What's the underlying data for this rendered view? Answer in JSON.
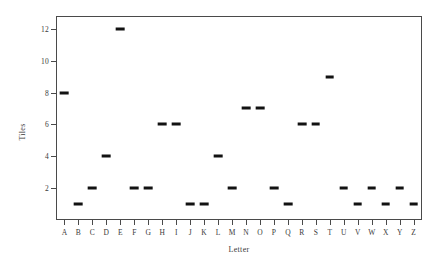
{
  "chart_data": {
    "type": "scatter",
    "title": "",
    "subtitle": "",
    "xlabel": "Letter",
    "ylabel": "Tiles",
    "categories": [
      "A",
      "B",
      "C",
      "D",
      "E",
      "F",
      "G",
      "H",
      "I",
      "J",
      "K",
      "L",
      "M",
      "N",
      "O",
      "P",
      "Q",
      "R",
      "S",
      "T",
      "U",
      "V",
      "W",
      "X",
      "Y",
      "Z"
    ],
    "values": [
      8,
      1,
      2,
      4,
      12,
      2,
      2,
      6,
      6,
      1,
      1,
      4,
      2,
      7,
      7,
      2,
      1,
      6,
      6,
      9,
      2,
      1,
      2,
      1,
      2,
      1
    ],
    "ytick_labels": [
      "2",
      "4",
      "6",
      "8",
      "10",
      "12"
    ],
    "ytick_values": [
      2,
      4,
      6,
      8,
      10,
      12
    ],
    "ylim": [
      0,
      12.8
    ],
    "xlim": [
      0.4,
      26.6
    ],
    "grid": false,
    "legend": null,
    "marker_style": "horizontal-dash",
    "marker_color": "#121212",
    "frame_color": "#4a4a4a",
    "background_color": "#ffffff"
  }
}
